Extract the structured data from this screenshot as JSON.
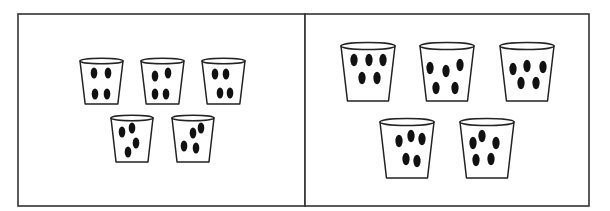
{
  "figure": {
    "colors": {
      "frame": "#333333",
      "cup_outline": "#222222",
      "bead": "#111111",
      "background": "#ffffff"
    }
  },
  "panels": [
    {
      "name": "left-panel",
      "box": {
        "x": 18,
        "y": 14,
        "w": 287,
        "h": 192
      },
      "cups": [
        {
          "x": 80,
          "y": 61,
          "w": 43,
          "h": 43,
          "beads": [
            [
              94,
              73
            ],
            [
              108,
              73
            ],
            [
              95,
              94
            ],
            [
              107,
              94
            ]
          ]
        },
        {
          "x": 141,
          "y": 61,
          "w": 43,
          "h": 43,
          "beads": [
            [
              155,
              76
            ],
            [
              168,
              73
            ],
            [
              155,
              94
            ],
            [
              166,
              94
            ]
          ]
        },
        {
          "x": 202,
          "y": 61,
          "w": 43,
          "h": 43,
          "beads": [
            [
              215,
              74
            ],
            [
              226,
              74
            ],
            [
              220,
              93
            ],
            [
              230,
              93
            ]
          ]
        },
        {
          "x": 111,
          "y": 118,
          "w": 42,
          "h": 44,
          "beads": [
            [
              122,
              132
            ],
            [
              132,
              128
            ],
            [
              136,
              143
            ],
            [
              128,
              152
            ]
          ]
        },
        {
          "x": 172,
          "y": 118,
          "w": 42,
          "h": 44,
          "beads": [
            [
              184,
              146
            ],
            [
              193,
              133
            ],
            [
              201,
              128
            ],
            [
              196,
              148
            ]
          ]
        }
      ],
      "bead_counts": [
        4,
        4,
        4,
        4,
        4
      ]
    },
    {
      "name": "right-panel",
      "box": {
        "x": 305,
        "y": 14,
        "w": 284,
        "h": 192
      },
      "cups": [
        {
          "x": 341,
          "y": 46,
          "w": 54,
          "h": 55,
          "beads": [
            [
              354,
              60
            ],
            [
              369,
              60
            ],
            [
              383,
              60
            ],
            [
              362,
              78
            ],
            [
              377,
              78
            ]
          ]
        },
        {
          "x": 420,
          "y": 46,
          "w": 54,
          "h": 55,
          "beads": [
            [
              430,
              68
            ],
            [
              446,
              71
            ],
            [
              460,
              65
            ],
            [
              436,
              88
            ],
            [
              455,
              88
            ]
          ]
        },
        {
          "x": 500,
          "y": 46,
          "w": 54,
          "h": 55,
          "beads": [
            [
              513,
              69
            ],
            [
              527,
              66
            ],
            [
              543,
              67
            ],
            [
              521,
              83
            ],
            [
              536,
              83
            ]
          ]
        },
        {
          "x": 380,
          "y": 122,
          "w": 54,
          "h": 56,
          "beads": [
            [
              399,
              141
            ],
            [
              411,
              136
            ],
            [
              422,
              139
            ],
            [
              406,
              159
            ],
            [
              417,
              161
            ]
          ]
        },
        {
          "x": 460,
          "y": 122,
          "w": 54,
          "h": 56,
          "beads": [
            [
              473,
              143
            ],
            [
              482,
              136
            ],
            [
              496,
              143
            ],
            [
              476,
              160
            ],
            [
              491,
              159
            ]
          ]
        }
      ],
      "bead_counts": [
        5,
        5,
        5,
        5,
        5
      ]
    }
  ]
}
